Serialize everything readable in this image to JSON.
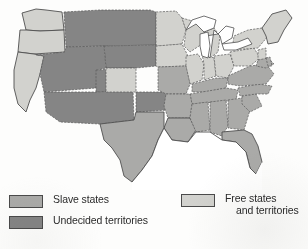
{
  "figure": {
    "background_color": "#fdfdfc"
  },
  "legend": {
    "columns": [
      {
        "name": "left",
        "entries": [
          {
            "key": "slave-states",
            "label": "Slave states",
            "label_line2": "",
            "color": "#aaaaa8",
            "border_color": "#4a4a4a"
          },
          {
            "key": "undecided-territories",
            "label": "Undecided territories",
            "label_line2": "",
            "color": "#858585",
            "border_color": "#4a4a4a"
          }
        ]
      },
      {
        "name": "right",
        "entries": [
          {
            "key": "free-states-and-territories",
            "label": "Free states",
            "label_line2": "and territories",
            "color": "#d2d2ce",
            "border_color": "#4a4a4a"
          }
        ]
      }
    ]
  },
  "map": {
    "water_color": "#ffffff",
    "outline_color": "#4f4f4f",
    "state_border_color": "#5a5a5a",
    "categories": {
      "slave": "#aaaaa8",
      "free": "#d2d2ce",
      "undecided": "#858585"
    },
    "regions": [
      {
        "name": "washington-territory",
        "category": "free"
      },
      {
        "name": "oregon",
        "category": "free"
      },
      {
        "name": "california",
        "category": "free"
      },
      {
        "name": "nevada-utah-territory",
        "category": "undecided"
      },
      {
        "name": "new-mexico-territory",
        "category": "undecided"
      },
      {
        "name": "colorado-territory",
        "category": "undecided"
      },
      {
        "name": "dakota-territory",
        "category": "undecided"
      },
      {
        "name": "nebraska-territory",
        "category": "undecided"
      },
      {
        "name": "indian-territory",
        "category": "undecided"
      },
      {
        "name": "kansas",
        "category": "free"
      },
      {
        "name": "minnesota",
        "category": "free"
      },
      {
        "name": "iowa",
        "category": "free"
      },
      {
        "name": "wisconsin",
        "category": "free"
      },
      {
        "name": "illinois",
        "category": "free"
      },
      {
        "name": "indiana",
        "category": "free"
      },
      {
        "name": "ohio",
        "category": "free"
      },
      {
        "name": "michigan",
        "category": "free"
      },
      {
        "name": "pennsylvania",
        "category": "free"
      },
      {
        "name": "new-york",
        "category": "free"
      },
      {
        "name": "new-england",
        "category": "free"
      },
      {
        "name": "new-jersey",
        "category": "free"
      },
      {
        "name": "missouri",
        "category": "slave"
      },
      {
        "name": "arkansas",
        "category": "slave"
      },
      {
        "name": "texas",
        "category": "slave"
      },
      {
        "name": "louisiana",
        "category": "slave"
      },
      {
        "name": "mississippi",
        "category": "slave"
      },
      {
        "name": "alabama",
        "category": "slave"
      },
      {
        "name": "tennessee",
        "category": "slave"
      },
      {
        "name": "kentucky",
        "category": "slave"
      },
      {
        "name": "georgia",
        "category": "slave"
      },
      {
        "name": "florida",
        "category": "slave"
      },
      {
        "name": "south-carolina",
        "category": "slave"
      },
      {
        "name": "north-carolina",
        "category": "slave"
      },
      {
        "name": "virginia",
        "category": "slave"
      },
      {
        "name": "maryland",
        "category": "slave"
      },
      {
        "name": "delaware",
        "category": "slave"
      }
    ],
    "water_bodies": [
      {
        "name": "great-lakes"
      },
      {
        "name": "gulf-of-mexico"
      },
      {
        "name": "atlantic-ocean"
      },
      {
        "name": "pacific-ocean"
      }
    ]
  }
}
